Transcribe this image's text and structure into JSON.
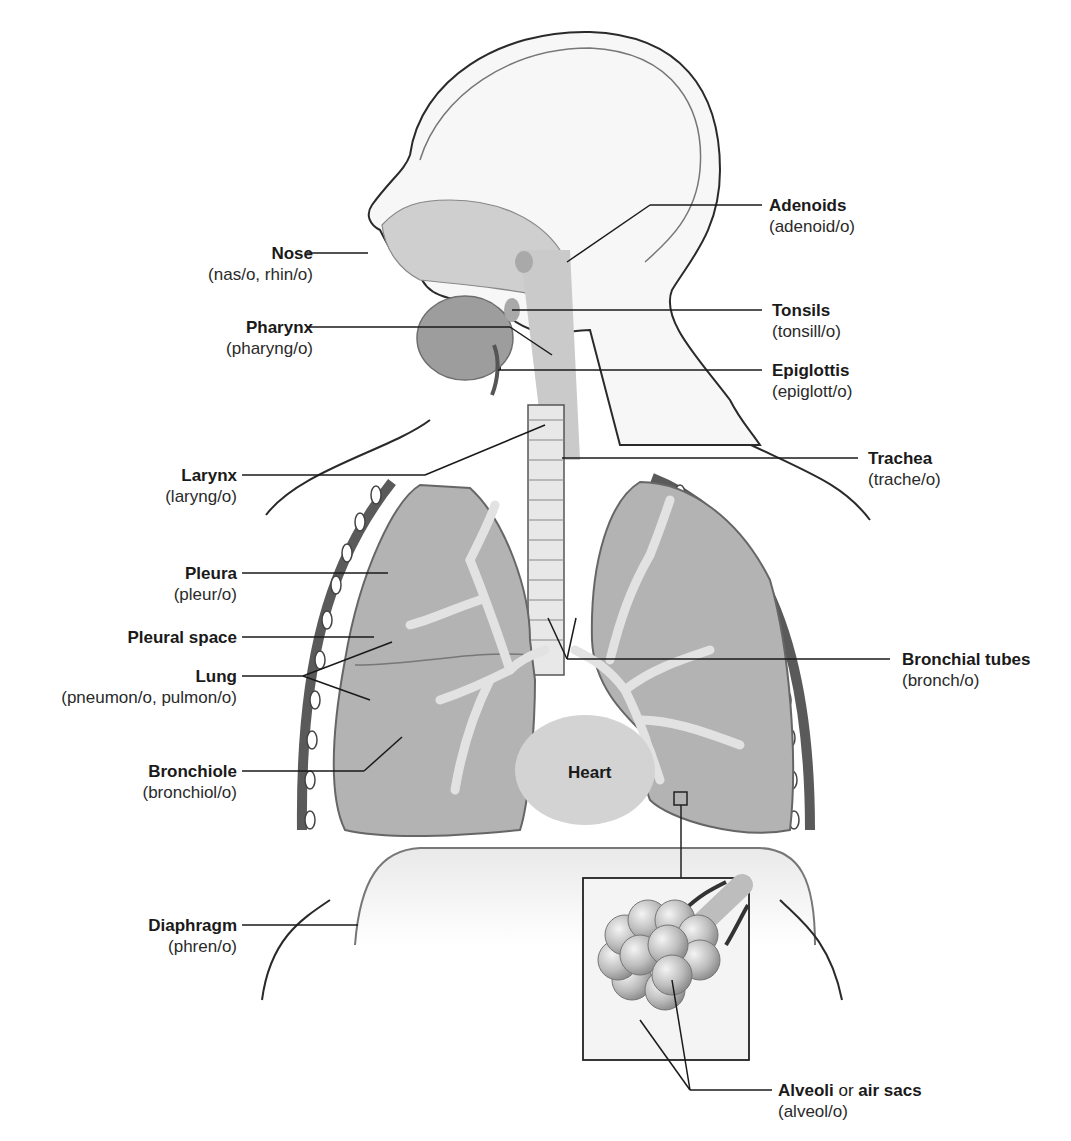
{
  "diagram": {
    "labels_left": [
      {
        "id": "nose",
        "term": "Nose",
        "root": "(nas/o, rhin/o)"
      },
      {
        "id": "pharynx",
        "term": "Pharynx",
        "root": "(pharyng/o)"
      },
      {
        "id": "larynx",
        "term": "Larynx",
        "root": "(laryng/o)"
      },
      {
        "id": "pleura",
        "term": "Pleura",
        "root": "(pleur/o)"
      },
      {
        "id": "pleural-space",
        "term": "Pleural space",
        "root": ""
      },
      {
        "id": "lung",
        "term": "Lung",
        "root": "(pneumon/o, pulmon/o)"
      },
      {
        "id": "bronchiole",
        "term": "Bronchiole",
        "root": "(bronchiol/o)"
      },
      {
        "id": "diaphragm",
        "term": "Diaphragm",
        "root": "(phren/o)"
      }
    ],
    "labels_right": [
      {
        "id": "adenoids",
        "term": "Adenoids",
        "root": "(adenoid/o)"
      },
      {
        "id": "tonsils",
        "term": "Tonsils",
        "root": "(tonsill/o)"
      },
      {
        "id": "epiglottis",
        "term": "Epiglottis",
        "root": "(epiglott/o)"
      },
      {
        "id": "trachea",
        "term": "Trachea",
        "root": "(trache/o)"
      },
      {
        "id": "bronchial-tubes",
        "term": "Bronchial tubes",
        "root": "(bronch/o)"
      },
      {
        "id": "alveoli",
        "term": "Alveoli",
        "connector": " or ",
        "term2": "air sacs",
        "root": "(alveol/o)"
      }
    ],
    "inline_labels": {
      "heart": "Heart"
    },
    "colors": {
      "line": "#1a1a1a",
      "tissue_light": "#e6e6e6",
      "tissue_mid": "#c4c4c4",
      "tissue_dark": "#9a9a9a",
      "lung_fill": "#b3b3b3",
      "rib_dark": "#5a5a5a"
    }
  }
}
